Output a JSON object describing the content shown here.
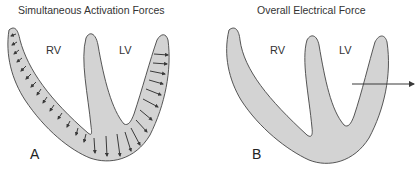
{
  "panels": {
    "a": {
      "title": "Simultaneous Activation Forces",
      "rv_label": "RV",
      "lv_label": "LV",
      "letter": "A"
    },
    "b": {
      "title": "Overall Electrical Force",
      "rv_label": "RV",
      "lv_label": "LV",
      "letter": "B"
    }
  },
  "colors": {
    "tissue_fill": "#d3d3d3",
    "outline": "#444444",
    "arrow": "#3a3a3a"
  }
}
